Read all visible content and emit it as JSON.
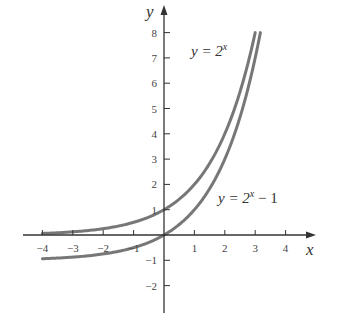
{
  "chart_data": {
    "type": "line",
    "title": "",
    "xlabel": "x",
    "ylabel": "y",
    "xlim": [
      -4.5,
      5
    ],
    "ylim": [
      -2.8,
      9
    ],
    "grid": false,
    "x_ticks": [
      -4,
      -3,
      -2,
      -1,
      1,
      2,
      3,
      4
    ],
    "y_ticks": [
      -2,
      -1,
      1,
      2,
      3,
      4,
      5,
      6,
      7,
      8
    ],
    "x_tick_labels": [
      "−4",
      "−3",
      "−2",
      "−1",
      "1",
      "2",
      "3",
      "4"
    ],
    "y_tick_labels": [
      "−2",
      "−1",
      "1",
      "2",
      "3",
      "4",
      "5",
      "6",
      "7",
      "8"
    ],
    "series": [
      {
        "name": "y = 2^x",
        "label_main": "y = 2",
        "label_sup": "x",
        "label_tail": "",
        "x": [
          -4,
          -3,
          -2,
          -1,
          0,
          1,
          2,
          3
        ],
        "values": [
          0.0625,
          0.125,
          0.25,
          0.5,
          1,
          2,
          4,
          8
        ],
        "color": "#777777"
      },
      {
        "name": "y = 2^x − 1",
        "label_main": "y = 2",
        "label_sup": "x",
        "label_tail": " − 1",
        "x": [
          -4,
          -3,
          -2,
          -1,
          0,
          1,
          2,
          3,
          3.17
        ],
        "values": [
          -0.9375,
          -0.875,
          -0.75,
          -0.5,
          0,
          1,
          3,
          7,
          8
        ],
        "color": "#777777"
      }
    ],
    "annotations": [
      "y = 2^x",
      "y = 2^x − 1"
    ],
    "legend": "none (inline curve labels)"
  }
}
